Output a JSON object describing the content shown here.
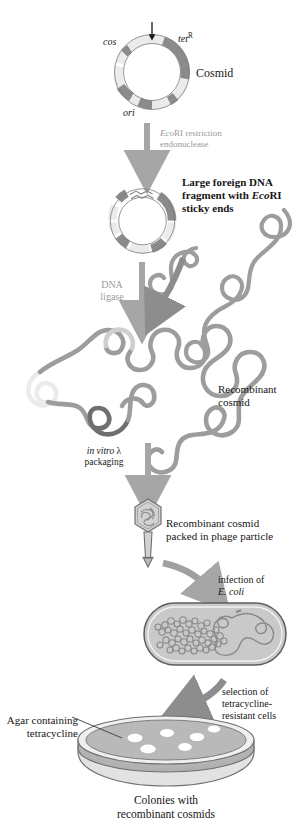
{
  "figure": {
    "type": "diagram"
  },
  "steps": {
    "cosmid": {
      "title": "Cosmid",
      "gene_cos": "cos",
      "gene_tet": "tet",
      "gene_tet_sup": "R",
      "gene_ori": "ori"
    },
    "digest": {
      "line1_italic": "Eco",
      "line1_rest": "RI restriction",
      "line2": "endonuclease"
    },
    "fragment": {
      "line1": "Large foreign DNA",
      "line2_pre": "fragment with ",
      "line2_italic": "Eco",
      "line2_post": "RI",
      "line3": "sticky ends"
    },
    "ligase": {
      "line1": "DNA",
      "line2": "ligase"
    },
    "recombinant": {
      "line1": "Recombinant",
      "line2": "cosmid"
    },
    "packaging": {
      "line1_italic": "in vitro",
      "line1_lambda": " λ",
      "line2": "packaging"
    },
    "phage": {
      "line1": "Recombinant cosmid",
      "line2": "packed in phage particle"
    },
    "infection": {
      "line1": "infection of",
      "line2_italic": "E. coli"
    },
    "selection": {
      "line1": "selection of",
      "line2": "tetracycline-",
      "line3": "resistant cells"
    },
    "plate": {
      "agar_line1": "Agar containing",
      "agar_line2": "tetracycline",
      "caption_line1": "Colonies with",
      "caption_line2": "recombinant cosmids"
    }
  },
  "colors": {
    "dark_segment": "#8b8b8b",
    "light_segment": "#eceaea",
    "outline": "#6f6f6f",
    "dna_strand": "#9d9d9d",
    "arrow_gray": "#a6a6a6",
    "arrow_dark": "#8a8a8a",
    "cell_fill": "#c9c9c9",
    "agar_fill": "#b9b9b9",
    "colony_fill": "#ffffff",
    "text_black": "#161616",
    "text_gray": "#9a9a9a"
  }
}
